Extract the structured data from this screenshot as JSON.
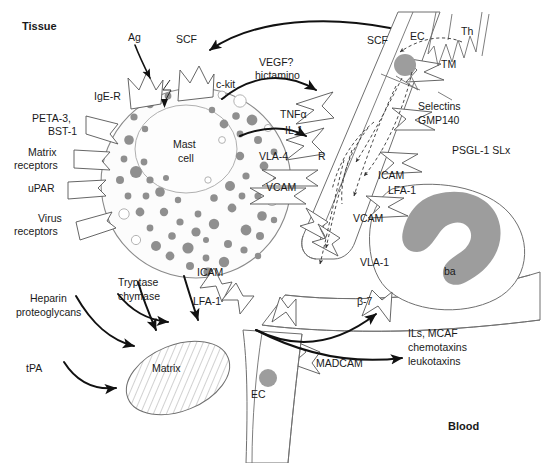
{
  "figure": {
    "title_regions": {
      "tissue": "Tissue",
      "blood": "Blood"
    },
    "cells": {
      "mast_cell": "Mast\ncell",
      "mast_cell_line1": "Mast",
      "mast_cell_line2": "cell",
      "basophil": "ba",
      "t_helper": "Th",
      "endothelial_top": "EC",
      "endothelial_bottom": "EC",
      "matrix": "Matrix"
    },
    "mast_cell_receptors_left": [
      {
        "label_line1": "PETA-3,",
        "label_line2": "BST-1"
      },
      {
        "label_line1": "Matrix",
        "label_line2": "receptors"
      },
      {
        "label_line1": "uPAR",
        "label_line2": ""
      },
      {
        "label_line1": "Virus",
        "label_line2": "receptors"
      }
    ],
    "mast_cell_receptors_top": [
      {
        "label": "IgE-R"
      },
      {
        "label": "c-kit"
      }
    ],
    "stimuli": [
      {
        "label": "Ag"
      },
      {
        "label": "SCF"
      }
    ],
    "mediators_to_endothelium": [
      {
        "label_line1": "VEGF?",
        "label_line2": "hictamino"
      },
      {
        "label_line1": "TNFα",
        "label_line2": "IL-1"
      }
    ],
    "scf_to_vessel": "SCF",
    "adhesion_molecules": [
      {
        "label": "VLA-4"
      },
      {
        "label": "R"
      },
      {
        "label": "VCAM"
      },
      {
        "label": "ICAM"
      },
      {
        "label": "LFA-1"
      },
      {
        "label": "VCAM"
      },
      {
        "label": "VLA-1"
      },
      {
        "label": "ICAM"
      },
      {
        "label": "LFA-1"
      },
      {
        "label": "β-7"
      },
      {
        "label": "MADCAM"
      },
      {
        "label": "TM"
      },
      {
        "label": "PSGL-1 SLx"
      }
    ],
    "endothelium_labels": {
      "selectins_line1": "Selectins",
      "selectins_line2": "GMP140",
      "psgl": "PSGL-1 SLx",
      "tm": "TM"
    },
    "mast_cell_products": [
      {
        "label_line1": "Heparin",
        "label_line2": "proteoglycans"
      },
      {
        "label_line1": "Tryptase",
        "label_line2": "chymase"
      },
      {
        "label_line1": "tPA",
        "label_line2": ""
      }
    ],
    "basophil_products": {
      "line1": "ILs, MCAF",
      "line2": "chemotaxins",
      "line3": "leukotaxins"
    },
    "colors": {
      "granule_gray": "#8f8f8f",
      "nucleus_gray": "#9d9d9d",
      "outline_dark": "#2b2b2b",
      "outline_mid": "#6f6f6f",
      "cell_membrane": "#8a8a8a",
      "text": "#1a1a1a",
      "background": "#ffffff"
    }
  }
}
